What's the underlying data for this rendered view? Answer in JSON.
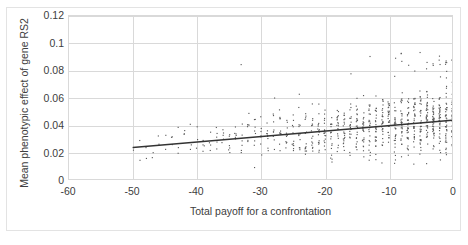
{
  "chart_data": {
    "type": "scatter",
    "title": "",
    "xlabel": "Total payoff for a confrontation",
    "ylabel": "Mean phenotypic effect of gene RS2",
    "xlim": [
      -60,
      0
    ],
    "ylim": [
      0,
      0.12
    ],
    "xticks": [
      "-60",
      "-50",
      "-40",
      "-30",
      "-20",
      "-10",
      "0"
    ],
    "xtick_values": [
      -60,
      -50,
      -40,
      -30,
      -20,
      -10,
      0
    ],
    "yticks": [
      "0",
      "0.02",
      "0.04",
      "0.06",
      "0.08",
      "0.1",
      "0.12"
    ],
    "ytick_values": [
      0,
      0.02,
      0.04,
      0.06,
      0.08,
      0.1,
      0.12
    ],
    "grid": "both",
    "legend": "none",
    "marker_color": "#595959",
    "trendline_color": "#333333",
    "gridline_color": "#d9d9d9",
    "series": [
      {
        "name": "Mean phenotypic effect of gene RS2",
        "marker": "dot",
        "x_range": [
          -50,
          0
        ],
        "n_points": 1180,
        "description": "Dense upward-sloping cloud of small dark dots; density increases strongly toward x = 0; bulk of points between y = 0.015 and y = 0.05 with a sparse upper tail reaching y = 0.09.",
        "points_sample": [
          [
            -50,
            0.0245
          ],
          [
            -49,
            0.0233
          ],
          [
            -48,
            0.0268
          ],
          [
            -47,
            0.0222
          ],
          [
            -46,
            0.0301
          ],
          [
            -45,
            0.0256
          ],
          [
            -44,
            0.024
          ],
          [
            -43,
            0.0345
          ],
          [
            -42,
            0.0262
          ],
          [
            -41,
            0.0289
          ],
          [
            -40,
            0.0252
          ],
          [
            -39,
            0.0318
          ],
          [
            -38,
            0.0274
          ],
          [
            -37,
            0.0421
          ],
          [
            -36,
            0.0246
          ],
          [
            -35,
            0.0293
          ],
          [
            -34,
            0.0551
          ],
          [
            -33,
            0.0267
          ],
          [
            -32,
            0.0338
          ],
          [
            -31,
            0.0281
          ],
          [
            -30,
            0.031
          ],
          [
            -29,
            0.0452
          ],
          [
            -28,
            0.0275
          ],
          [
            -27,
            0.0362
          ],
          [
            -26,
            0.0298
          ],
          [
            -25,
            0.061
          ],
          [
            -24,
            0.0321
          ],
          [
            -23,
            0.0289
          ],
          [
            -22,
            0.0402
          ],
          [
            -21,
            0.0334
          ],
          [
            -20,
            0.0356
          ],
          [
            -19,
            0.0705
          ],
          [
            -18,
            0.0312
          ],
          [
            -17,
            0.0428
          ],
          [
            -16,
            0.0367
          ],
          [
            -15,
            0.0805
          ],
          [
            -14,
            0.0345
          ],
          [
            -13,
            0.0471
          ],
          [
            -12,
            0.0392
          ],
          [
            -11,
            0.0356
          ],
          [
            -10,
            0.0418
          ],
          [
            -9,
            0.0905
          ],
          [
            -8,
            0.0382
          ],
          [
            -7,
            0.0496
          ],
          [
            -6,
            0.0412
          ],
          [
            -5,
            0.0623
          ],
          [
            -4,
            0.0398
          ],
          [
            -3,
            0.0455
          ],
          [
            -2,
            0.0432
          ],
          [
            -1,
            0.0521
          ],
          [
            0,
            0.0445
          ]
        ]
      }
    ],
    "trendline": {
      "type": "linear",
      "x_start": -50,
      "y_start": 0.0232,
      "x_end": 0,
      "y_end": 0.0432,
      "slope": 0.0004,
      "intercept": 0.0432
    }
  }
}
